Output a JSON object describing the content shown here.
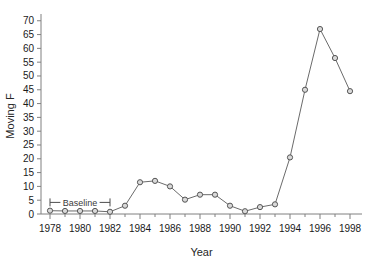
{
  "chart_data": {
    "type": "line",
    "title": "",
    "xlabel": "Year",
    "ylabel": "Moving F",
    "xlim": [
      1977.4,
      1998.8
    ],
    "ylim": [
      0,
      71
    ],
    "grid": false,
    "legend": "none",
    "marker": "open-circle",
    "line_color": "#6b6b6b",
    "marker_edge_color": "#555555",
    "marker_face_color": "#d9d9d9",
    "axis_color": "#808080",
    "x": [
      1978,
      1979,
      1980,
      1981,
      1982,
      1983,
      1984,
      1985,
      1986,
      1987,
      1988,
      1989,
      1990,
      1991,
      1992,
      1993,
      1994,
      1995,
      1996,
      1997,
      1998
    ],
    "values": [
      1.2,
      1.1,
      1.1,
      1.1,
      0.8,
      3.0,
      11.5,
      12.0,
      10.0,
      5.2,
      7.0,
      7.0,
      3.0,
      1.0,
      2.5,
      3.5,
      20.5,
      45.0,
      67.0,
      56.5,
      44.5
    ],
    "xticks": [
      1978,
      1980,
      1982,
      1984,
      1986,
      1988,
      1990,
      1992,
      1994,
      1996,
      1998
    ],
    "xtick_labels": [
      "1978",
      "1980",
      "1982",
      "1984",
      "1986",
      "1988",
      "1990",
      "1992",
      "1994",
      "1996",
      "1998"
    ],
    "xticks_minor": [
      1979,
      1981,
      1983,
      1985,
      1987,
      1989,
      1991,
      1993,
      1995,
      1997
    ],
    "yticks": [
      0,
      5,
      10,
      15,
      20,
      25,
      30,
      35,
      40,
      45,
      50,
      55,
      60,
      65,
      70
    ],
    "ytick_labels": [
      "0",
      "5",
      "10",
      "15",
      "20",
      "25",
      "30",
      "35",
      "40",
      "45",
      "50",
      "55",
      "60",
      "65",
      "70"
    ],
    "annotations": [
      {
        "name": "baseline-bracket",
        "text": "Baseline",
        "x_start": 1978,
        "x_end": 1982,
        "y": 4.2
      }
    ]
  }
}
